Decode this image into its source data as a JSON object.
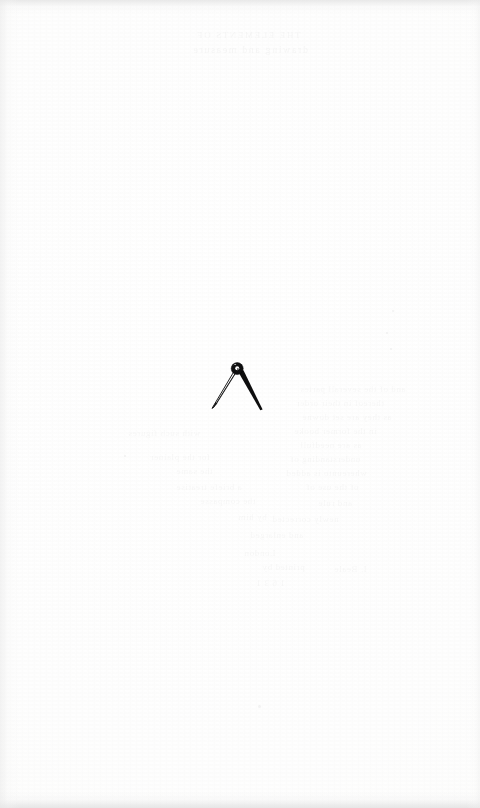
{
  "page": {
    "kind": "scanned-book-page",
    "width": 480,
    "height": 808,
    "paper_color": "#fefefe",
    "ink_color": "#111111",
    "body_text": "",
    "page_number": "",
    "running_head": ""
  },
  "emblem": {
    "name": "printer-device-compass",
    "label": "Printer's device: a pair of drawing compasses (dividers)",
    "ink_color": "#101010",
    "center_x": 237,
    "center_y": 387,
    "hinge": {
      "center_x": 237,
      "center_y": 369,
      "outer_radius": 6.0,
      "inner_radius": 1.9,
      "note": "circular pivot knob with small open bore"
    },
    "left_leg": {
      "style": "open-outline",
      "tip_x": 208,
      "tip_y": 408,
      "note": "slender two-line outlined leg, hollow interior"
    },
    "right_leg": {
      "style": "solid-filled",
      "tip_x": 261,
      "tip_y": 409,
      "note": "solid black tapering leg, broader than the left"
    }
  },
  "bleed_through": {
    "note": "faint mirrored show-through of type printed on the reverse leaf",
    "opacity": 0.055,
    "header_lines": [
      {
        "text": "THE  ELEMENTS  OF",
        "x": 196,
        "y": 30,
        "size": 9
      },
      {
        "text": "drawing and measure",
        "x": 192,
        "y": 44,
        "size": 10
      }
    ],
    "body_lines": [
      {
        "text": "and of the severall partes",
        "x": 300,
        "y": 384,
        "size": 9
      },
      {
        "text": "thereof in their order",
        "x": 296,
        "y": 398,
        "size": 9
      },
      {
        "text": "as they are set downe",
        "x": 302,
        "y": 412,
        "size": 9
      },
      {
        "text": "in the former booke",
        "x": 294,
        "y": 426,
        "size": 9
      },
      {
        "text": "with such figures",
        "x": 128,
        "y": 428,
        "size": 9
      },
      {
        "text": "as are needfull",
        "x": 300,
        "y": 440,
        "size": 9
      },
      {
        "text": "for the plainer",
        "x": 150,
        "y": 452,
        "size": 9
      },
      {
        "text": "understanding of",
        "x": 290,
        "y": 454,
        "size": 9
      },
      {
        "text": "the same",
        "x": 176,
        "y": 466,
        "size": 9
      },
      {
        "text": "whereunto is added",
        "x": 286,
        "y": 468,
        "size": 9
      },
      {
        "text": "a briefe treatise",
        "x": 176,
        "y": 482,
        "size": 9
      },
      {
        "text": "of the use of",
        "x": 306,
        "y": 482,
        "size": 9
      },
      {
        "text": "the compasse",
        "x": 200,
        "y": 496,
        "size": 9
      },
      {
        "text": "and rule",
        "x": 318,
        "y": 498,
        "size": 9
      },
      {
        "text": "by him",
        "x": 238,
        "y": 512,
        "size": 9
      },
      {
        "text": "newly corrected",
        "x": 272,
        "y": 514,
        "size": 9
      },
      {
        "text": "and enlarged",
        "x": 250,
        "y": 530,
        "size": 9
      },
      {
        "text": "London",
        "x": 244,
        "y": 548,
        "size": 9
      },
      {
        "text": "printed by",
        "x": 262,
        "y": 562,
        "size": 9
      },
      {
        "text": "I. Beale",
        "x": 334,
        "y": 564,
        "size": 9
      },
      {
        "text": "1 6 3 1",
        "x": 256,
        "y": 578,
        "size": 9
      }
    ],
    "specks": [
      {
        "x": 258,
        "y": 705,
        "size": 3
      },
      {
        "x": 392,
        "y": 310,
        "size": 2
      },
      {
        "x": 386,
        "y": 332,
        "size": 2
      },
      {
        "x": 390,
        "y": 348,
        "size": 2
      },
      {
        "x": 124,
        "y": 455,
        "size": 2
      }
    ]
  }
}
